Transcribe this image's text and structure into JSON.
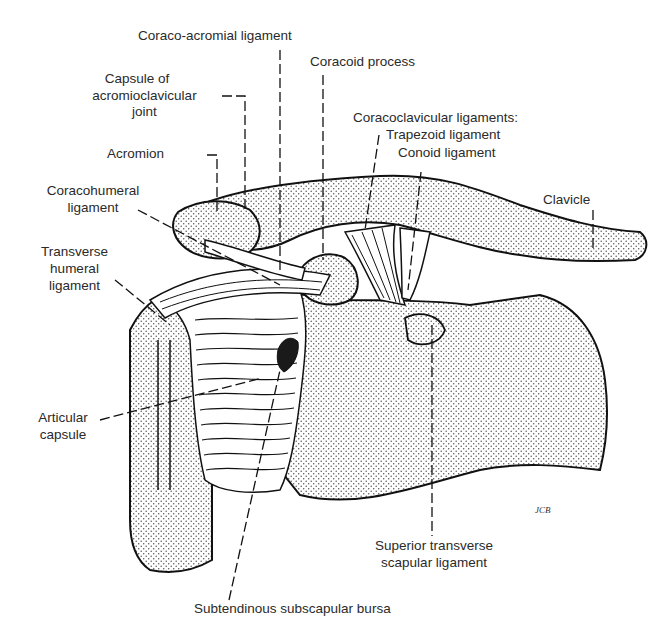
{
  "figure": {
    "labels": {
      "coraco_acromial": "Coraco-acromial ligament",
      "coracoid_process": "Coracoid process",
      "capsule_ac_1": "Capsule of",
      "capsule_ac_2": "acromioclavicular",
      "capsule_ac_3": "joint",
      "coracoclavicular": "Coracoclavicular ligaments:",
      "trapezoid": "Trapezoid ligament",
      "conoid": "Conoid ligament",
      "acromion": "Acromion",
      "coracohumeral_1": "Coracohumeral",
      "coracohumeral_2": "ligament",
      "clavicle": "Clavicle",
      "transverse_humeral_1": "Transverse",
      "transverse_humeral_2": "humeral",
      "transverse_humeral_3": "ligament",
      "articular_capsule_1": "Articular",
      "articular_capsule_2": "capsule",
      "superior_transverse_1": "Superior transverse",
      "superior_transverse_2": "scapular ligament",
      "subtendinous_bursa": "Subtendinous subscapular bursa",
      "signature": "JCB"
    }
  }
}
